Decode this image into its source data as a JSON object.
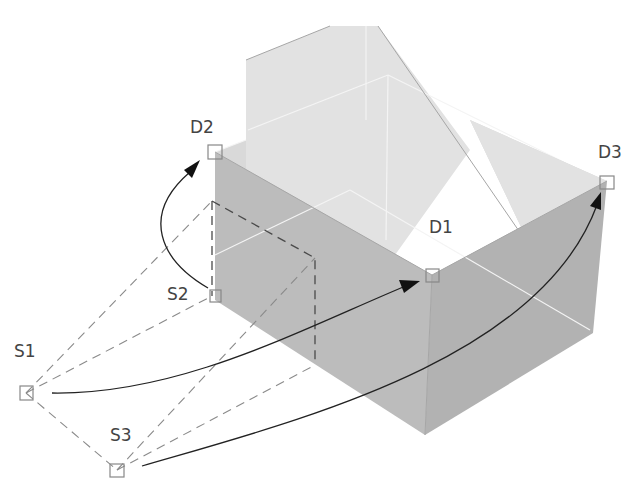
{
  "diagram": {
    "labels": {
      "d1": "D1",
      "d2": "D2",
      "d3": "D3",
      "s1": "S1",
      "s2": "S2",
      "s3": "S3"
    },
    "points": [
      {
        "id": "S1",
        "role": "source",
        "x": 26,
        "y": 393
      },
      {
        "id": "S2",
        "role": "source",
        "x": 215,
        "y": 296
      },
      {
        "id": "S3",
        "role": "source",
        "x": 117,
        "y": 470
      },
      {
        "id": "D1",
        "role": "destination",
        "x": 432,
        "y": 275
      },
      {
        "id": "D2",
        "role": "destination",
        "x": 215,
        "y": 152
      },
      {
        "id": "D3",
        "role": "destination",
        "x": 607,
        "y": 181
      }
    ],
    "mappings": [
      {
        "from": "S1",
        "to": "D1"
      },
      {
        "from": "S2",
        "to": "D2"
      },
      {
        "from": "S3",
        "to": "D3"
      }
    ],
    "colors": {
      "solid_top": "#d9d9d9",
      "solid_side": "#b9b9b9",
      "arrow": "#222222",
      "dashed": "#8a8a8a",
      "label": "#444444"
    }
  }
}
